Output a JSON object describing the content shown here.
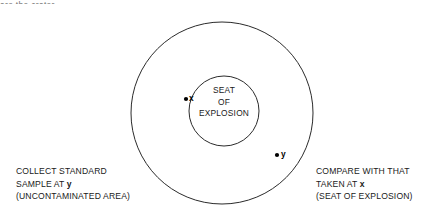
{
  "page": {
    "width": 439,
    "height": 223,
    "background": "#ffffff",
    "ink": "#1a1a1a",
    "stroke": "#2b2b2b"
  },
  "top_fragment": {
    "text": "are the  crater",
    "note": "partially cropped line of text at top edge"
  },
  "diagram": {
    "outer_circle": {
      "name": "outer-circle",
      "cx": 222,
      "cy": 113,
      "r": 91,
      "stroke": "#2b2b2b",
      "stroke_width": 1,
      "fill": "none"
    },
    "inner_circle": {
      "name": "inner-circle",
      "cx": 224,
      "cy": 111,
      "r": 35,
      "stroke": "#2b2b2b",
      "stroke_width": 1,
      "fill": "none"
    },
    "center_label": {
      "lines": [
        "SEAT",
        "OF",
        "EXPLOSION"
      ]
    },
    "points": [
      {
        "id": "x",
        "label": "x",
        "cx": 186,
        "cy": 99,
        "r": 2.1,
        "fill": "#000000",
        "description": "sample point inside inner circle (seat of explosion)"
      },
      {
        "id": "y",
        "label": "y",
        "cx": 277,
        "cy": 155,
        "r": 2.1,
        "fill": "#000000",
        "description": "standard sample point in uncontaminated area"
      }
    ]
  },
  "captions": {
    "left": {
      "line1": "COLLECT STANDARD",
      "line2_prefix": "SAMPLE AT ",
      "line2_point": "y",
      "line3": "(UNCONTAMINATED AREA)"
    },
    "right": {
      "line1": "COMPARE WITH THAT",
      "line2_prefix": "TAKEN AT ",
      "line2_point": "x",
      "line3": "(SEAT OF EXPLOSION)"
    }
  }
}
